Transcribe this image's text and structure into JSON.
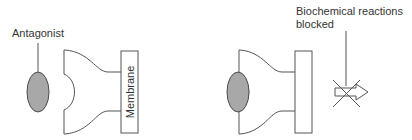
{
  "diagram": {
    "colors": {
      "ligand_fill": "#a8a8a8",
      "stroke": "#555555",
      "text": "#333333",
      "background": "#ffffff"
    },
    "left_panel": {
      "state": "antagonist-unbound",
      "ligand_label": "Antagonist",
      "membrane_label": "Membrane"
    },
    "right_panel": {
      "state": "antagonist-bound",
      "effect_label_line1": "Biochemical reactions",
      "effect_label_line2": "blocked",
      "effect_icon": "blocked-arrow-icon"
    }
  }
}
